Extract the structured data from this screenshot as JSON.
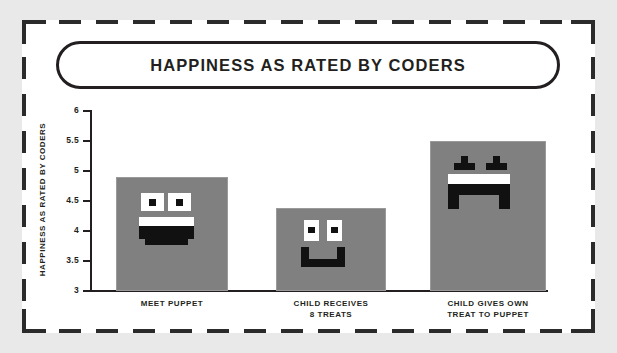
{
  "chart_data": {
    "type": "bar",
    "title": "HAPPINESS AS RATED BY CODERS",
    "xlabel": "",
    "ylabel": "HAPPINESS AS RATED BY CODERS",
    "categories": [
      "MEET PUPPET",
      "CHILD RECEIVES\n8 TREATS",
      "CHILD GIVES OWN\nTREAT TO PUPPET"
    ],
    "category_lines": [
      [
        "MEET PUPPET"
      ],
      [
        "CHILD RECEIVES",
        "8 TREATS"
      ],
      [
        "CHILD GIVES OWN",
        "TREAT TO PUPPET"
      ]
    ],
    "values": [
      4.9,
      4.38,
      5.5
    ],
    "ylim": [
      3,
      6
    ],
    "yticks": [
      "3",
      "3.5",
      "4",
      "4.5",
      "5",
      "5.5",
      "6"
    ],
    "ytick_values": [
      3,
      3.5,
      4,
      4.5,
      5,
      5.5,
      6
    ],
    "grid": false,
    "legend": false,
    "bar_color": "#808080",
    "axis_color": "#231f20",
    "face_white": "#ffffff",
    "face_black": "#111111",
    "bar_faces": [
      "happy-face-open-mouth",
      "happy-face-small-smile",
      "excited-face-star-eyes"
    ]
  },
  "frame": {
    "background_color": "#e9e9e9",
    "card_color": "#ffffff",
    "border_color": "#2b2b2b"
  }
}
